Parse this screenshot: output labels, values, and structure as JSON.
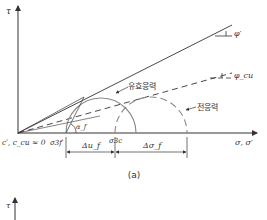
{
  "figure_a": {
    "caption": "(a)",
    "axes": {
      "y_label": "τ",
      "x_label": "σ, σ′",
      "origin_label": "c′, c_cu ≈ 0"
    },
    "envelopes": {
      "effective": {
        "angle_label": "φ′",
        "style": "solid"
      },
      "total": {
        "angle_label": "φ_cu",
        "style": "dashed"
      }
    },
    "circles": {
      "effective_label": "유효응력",
      "total_label": "전응력"
    },
    "annotations": {
      "failure_angle": "α_f",
      "sigma3f": "σ3f′",
      "sigma3c": "σ3c",
      "delta_u": "Δu_f",
      "delta_sigma": "Δσ_f"
    }
  },
  "figure_b": {
    "axes": {
      "y_label": "τ"
    }
  },
  "colors": {
    "line": "#333333",
    "circle": "#8a8a8a"
  }
}
